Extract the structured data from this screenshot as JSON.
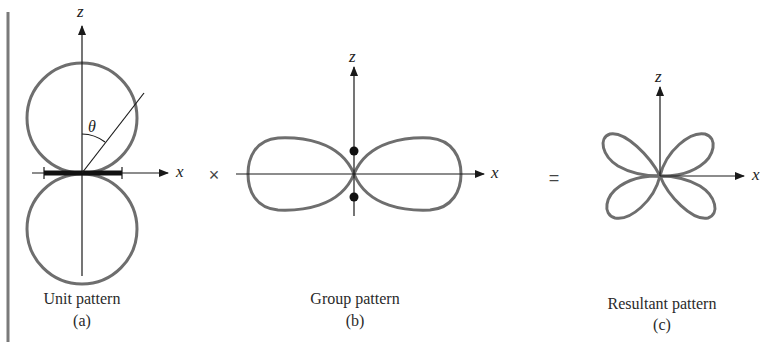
{
  "figure": {
    "panels": [
      {
        "id": "a",
        "caption": "Unit pattern",
        "sub": "(a)",
        "axes": {
          "vertical": "z",
          "horizontal": "x"
        },
        "angle_label": "θ",
        "shape": "two tangent circles above and below x-axis (doughnut/dipole-like pattern)"
      },
      {
        "id": "b",
        "caption": "Group pattern",
        "sub": "(b)",
        "axes": {
          "vertical": "z",
          "horizontal": "x"
        },
        "shape": "two horizontal lobes along x-axis with two point sources on z-axis"
      },
      {
        "id": "c",
        "caption": "Resultant pattern",
        "sub": "(c)",
        "axes": {
          "vertical": "z",
          "horizontal": "x"
        },
        "shape": "four diagonal lobes (product of unit and group pattern)"
      }
    ],
    "operators": {
      "times": "×",
      "equals": "="
    },
    "colors": {
      "pattern": "#6e6e6e",
      "axis": "#1a1a1a",
      "border": "#7a7a7a"
    }
  }
}
